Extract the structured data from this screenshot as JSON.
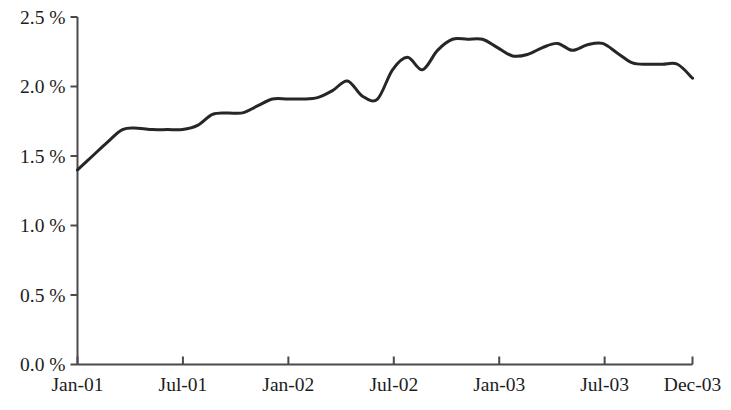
{
  "chart_data": {
    "type": "line",
    "title": "",
    "subtitle": "",
    "xlabel": "",
    "ylabel": "",
    "grid": false,
    "legend": null,
    "legend_position": "none",
    "line_color": "#262626",
    "line_width": 3,
    "axis_color": "#4a4a4a",
    "background": "#ffffff",
    "ylim": [
      0.0,
      2.5
    ],
    "ytick_values": [
      0.0,
      0.5,
      1.0,
      1.5,
      2.0,
      2.5
    ],
    "ytick_labels": [
      "0.0 %",
      "0.5 %",
      "1.0 %",
      "1.5 %",
      "2.0 %",
      "2.5 %"
    ],
    "xlim": [
      "Jan-01",
      "Dec-03"
    ],
    "xtick_labels": [
      "Jan-01",
      "Jul-01",
      "Jan-02",
      "Jul-02",
      "Jan-03",
      "Jul-03",
      "Dec-03"
    ],
    "xtick_positions": [
      0,
      6,
      12,
      18,
      24,
      30,
      35
    ],
    "x": [
      "Jan-01",
      "Feb-01",
      "Mar-01",
      "Apr-01",
      "May-01",
      "Jun-01",
      "Jul-01",
      "Aug-01",
      "Sep-01",
      "Oct-01",
      "Nov-01",
      "Dec-01",
      "Jan-02",
      "Feb-02",
      "Mar-02",
      "Apr-02",
      "May-02",
      "Jun-02",
      "Jul-02",
      "Aug-02",
      "Sep-02",
      "Oct-02",
      "Nov-02",
      "Dec-02",
      "Jan-03",
      "Feb-03",
      "Mar-03",
      "Apr-03",
      "May-03",
      "Jun-03",
      "Jul-03",
      "Aug-03",
      "Sep-03",
      "Oct-03",
      "Nov-03",
      "Dec-03"
    ],
    "values": [
      1.4,
      1.5,
      1.6,
      1.69,
      1.7,
      1.69,
      1.69,
      1.69,
      1.72,
      1.8,
      1.81,
      1.81,
      1.86,
      1.91,
      1.91,
      1.91,
      1.92,
      1.97,
      2.04,
      1.93,
      1.91,
      2.12,
      2.21,
      2.12,
      2.26,
      2.34,
      2.34,
      2.34,
      2.28,
      2.22,
      2.23,
      2.28,
      2.31,
      2.26,
      2.3,
      2.31
    ],
    "values_extended_tail": [
      2.24,
      2.17,
      2.16,
      2.16,
      2.16,
      2.06
    ],
    "series": [
      {
        "name": "rate",
        "values": [
          1.4,
          1.5,
          1.6,
          1.69,
          1.7,
          1.69,
          1.69,
          1.69,
          1.72,
          1.8,
          1.81,
          1.81,
          1.86,
          1.91,
          1.91,
          1.91,
          1.92,
          1.97,
          2.04,
          1.93,
          1.91,
          2.12,
          2.21,
          2.12,
          2.26,
          2.34,
          2.34,
          2.34,
          2.28,
          2.22,
          2.23,
          2.28,
          2.31,
          2.26,
          2.3,
          2.31
        ]
      }
    ],
    "notable_points": {
      "start": {
        "x": "Jan-01",
        "y": 1.4
      },
      "max": {
        "x": "Feb-03",
        "y": 2.34
      },
      "end": {
        "x": "Dec-03",
        "y": 2.06
      },
      "min": {
        "x": "Jan-01",
        "y": 1.4
      }
    }
  }
}
